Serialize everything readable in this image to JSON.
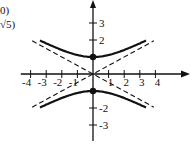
{
  "chart_data": {
    "type": "line",
    "title": "",
    "xlabel": "",
    "ylabel": "",
    "equation": "y^2 - x^2/4 = 1",
    "xlim": [
      -4.5,
      5.8
    ],
    "ylim": [
      -4.3,
      4.4
    ],
    "grid": false,
    "x_ticks": [
      -4,
      -3,
      -2,
      -1,
      1,
      2,
      3,
      4
    ],
    "x_tick_labels": [
      "-4",
      "-3",
      "-2",
      "-1",
      "1",
      "2",
      "3",
      "4"
    ],
    "y_ticks": [
      3,
      2,
      -2,
      -3
    ],
    "y_tick_labels": [
      "3",
      "2",
      "-2",
      "-3"
    ],
    "vertices": [
      [
        0,
        1
      ],
      [
        0,
        -1
      ]
    ],
    "series": [
      {
        "name": "upper branch",
        "style": "solid",
        "x": [
          -3.4,
          -3,
          -2,
          -1,
          0,
          1,
          2,
          3,
          3.4
        ],
        "y": [
          1.97,
          1.8,
          1.41,
          1.12,
          1.0,
          1.12,
          1.41,
          1.8,
          1.97
        ]
      },
      {
        "name": "lower branch",
        "style": "solid",
        "x": [
          -3.4,
          -3,
          -2,
          -1,
          0,
          1,
          2,
          3,
          3.4
        ],
        "y": [
          -1.97,
          -1.8,
          -1.41,
          -1.12,
          -1.0,
          -1.12,
          -1.41,
          -1.8,
          -1.97
        ]
      },
      {
        "name": "asymptote y = x/2",
        "style": "dashed",
        "x": [
          -3.9,
          3.9
        ],
        "y": [
          -1.95,
          1.95
        ]
      },
      {
        "name": "asymptote y = -x/2",
        "style": "dashed",
        "x": [
          -3.9,
          3.9
        ],
        "y": [
          1.95,
          -1.95
        ]
      }
    ],
    "annotations": [
      "0)",
      "√5)"
    ]
  },
  "labels": {
    "top_label_1": "0)",
    "top_label_2": "√5)"
  },
  "colors": {
    "ink": "#111111",
    "background": "#ffffff"
  }
}
